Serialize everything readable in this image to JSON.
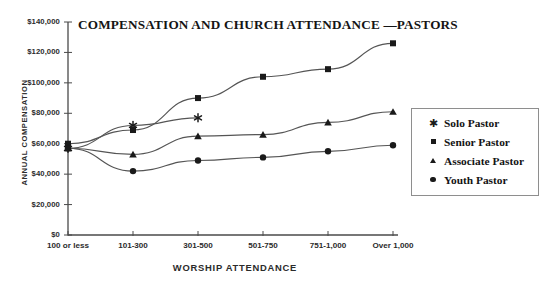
{
  "chart_data": {
    "type": "line",
    "title": "COMPENSATION AND CHURCH ATTENDANCE —PASTORS",
    "xlabel": "WORSHIP ATTENDANCE",
    "ylabel": "ANNUAL COMPENSATION",
    "categories": [
      "100 or less",
      "101-300",
      "301-500",
      "501-750",
      "751-1,000",
      "Over 1,000"
    ],
    "ylim": [
      0,
      140000
    ],
    "ytick_values": [
      0,
      20000,
      40000,
      60000,
      80000,
      100000,
      120000,
      140000
    ],
    "ytick_labels": [
      "$0",
      "$20,000",
      "$40,000",
      "$60,000",
      "$80,000",
      "$100,000",
      "$120,000",
      "$140,000"
    ],
    "grid": false,
    "legend_position": "right",
    "series": [
      {
        "name": "Solo Pastor",
        "marker": "star",
        "values": [
          57000,
          72000,
          77000,
          null,
          null,
          null
        ]
      },
      {
        "name": "Senior Pastor",
        "marker": "square",
        "values": [
          60000,
          69000,
          90000,
          104000,
          109000,
          126000
        ]
      },
      {
        "name": "Associate Pastor",
        "marker": "triangle",
        "values": [
          57000,
          53000,
          65000,
          66000,
          74000,
          81000
        ]
      },
      {
        "name": "Youth Pastor",
        "marker": "circle",
        "values": [
          57000,
          42000,
          49000,
          51000,
          55000,
          59000
        ]
      }
    ]
  },
  "legend": {
    "items": [
      {
        "label": "Solo Pastor",
        "marker": "star"
      },
      {
        "label": "Senior Pastor",
        "marker": "square"
      },
      {
        "label": "Associate Pastor",
        "marker": "triangle"
      },
      {
        "label": "Youth Pastor",
        "marker": "circle"
      }
    ]
  },
  "colors": {
    "line": "#555555",
    "marker": "#1a1a1a",
    "axis": "#4a4a4a",
    "text": "#2b2b2b",
    "background": "#ffffff"
  }
}
